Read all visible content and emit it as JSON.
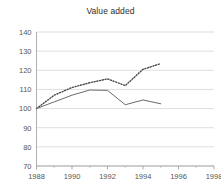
{
  "chart_data": {
    "type": "line",
    "title": "Value added",
    "xlabel": "",
    "ylabel": "",
    "xlim": [
      1988,
      1998
    ],
    "ylim": [
      70,
      140
    ],
    "grid": true,
    "legend": "none",
    "y_ticks": [
      70,
      80,
      90,
      100,
      110,
      120,
      130,
      140
    ],
    "x_ticks": [
      1988,
      1989,
      1990,
      1991,
      1992,
      1993,
      1994,
      1995,
      1996,
      1997,
      1998
    ],
    "x_tick_labels": [
      "1988",
      "",
      "1990",
      "",
      "1992",
      "",
      "1994",
      "",
      "1996",
      "",
      "1998"
    ],
    "x": [
      1988,
      1989,
      1990,
      1991,
      1992,
      1993,
      1994,
      1995
    ],
    "series": [
      {
        "name": "dotted-series",
        "style": "dotted",
        "color": "#4a4a4a",
        "values": [
          100,
          107,
          111,
          113.5,
          115.5,
          112,
          120.5,
          123.5
        ]
      },
      {
        "name": "solid-series",
        "style": "solid",
        "color": "#6b6b6b",
        "values": [
          100,
          103.5,
          107,
          109.7,
          109.5,
          102,
          104.5,
          102.5
        ]
      }
    ]
  }
}
